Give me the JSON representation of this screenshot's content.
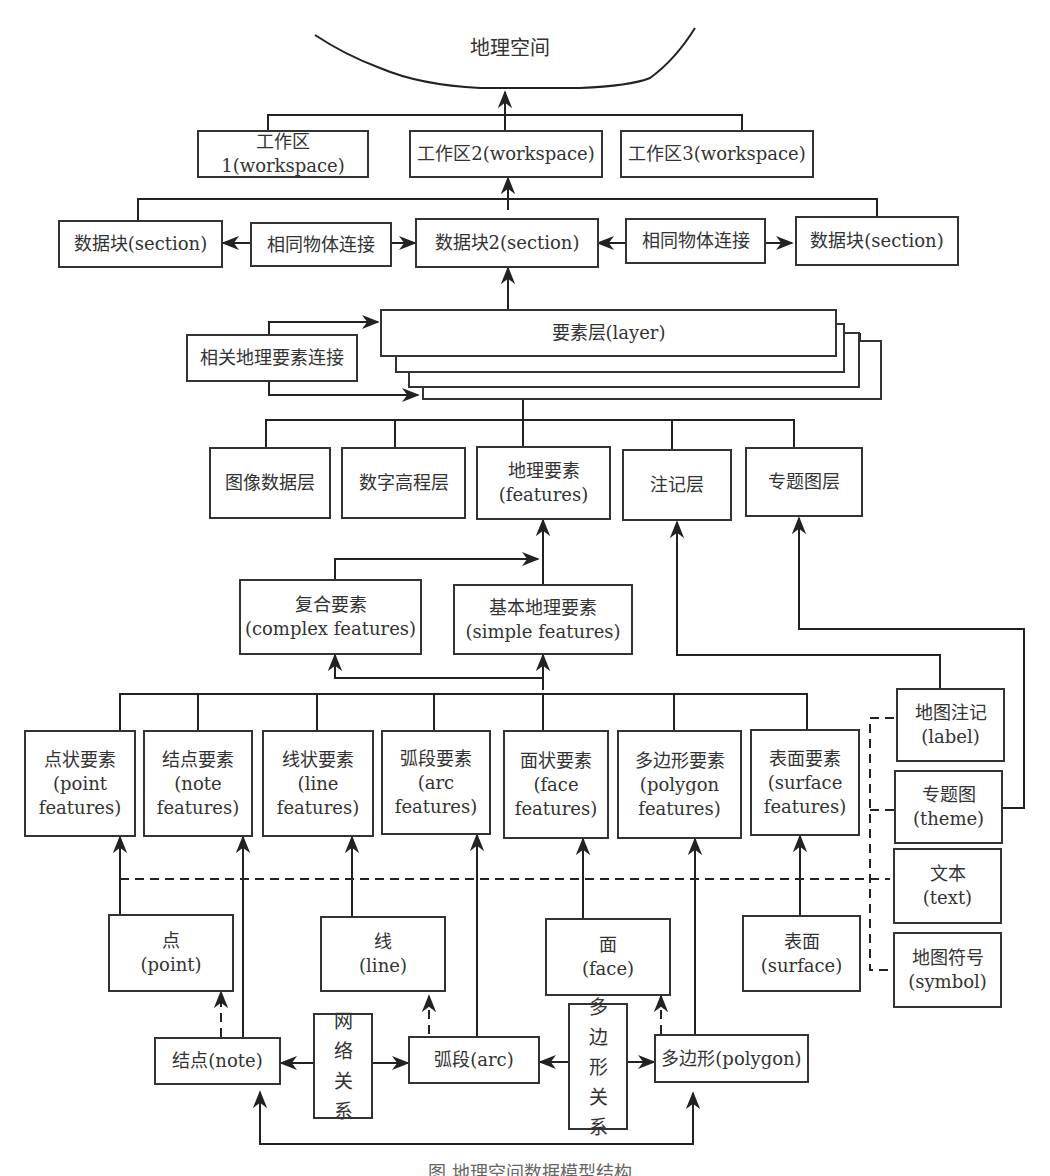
{
  "title": "地理空间",
  "workspaces": [
    {
      "label": "工作区1(workspace)"
    },
    {
      "label": "工作区2(workspace)"
    },
    {
      "label": "工作区3(workspace)"
    }
  ],
  "sections": {
    "left": "数据块(section)",
    "center": "数据块2(section)",
    "right": "数据块(section)",
    "link_left": "相同物体连接",
    "link_right": "相同物体连接"
  },
  "layer": {
    "label": "要素层(layer)",
    "link": "相关地理要素连接"
  },
  "layer_types": [
    {
      "line1": "图像数据层",
      "line2": ""
    },
    {
      "line1": "数字高程层",
      "line2": ""
    },
    {
      "line1": "地理要素",
      "line2": "(features)"
    },
    {
      "line1": "注记层",
      "line2": ""
    },
    {
      "line1": "专题图层",
      "line2": ""
    }
  ],
  "feature_kinds": [
    {
      "line1": "复合要素",
      "line2": "(complex features)"
    },
    {
      "line1": "基本地理要素",
      "line2": "(simple features)"
    }
  ],
  "simple_features": [
    {
      "line1": "点状要素",
      "line2": "(point",
      "line3": "features)"
    },
    {
      "line1": "结点要素",
      "line2": "(note",
      "line3": "features)"
    },
    {
      "line1": "线状要素",
      "line2": "(line",
      "line3": "features)"
    },
    {
      "line1": "弧段要素",
      "line2": "(arc",
      "line3": "features)"
    },
    {
      "line1": "面状要素",
      "line2": "(face",
      "line3": "features)"
    },
    {
      "line1": "多边形要素",
      "line2": "(polygon",
      "line3": "features)"
    },
    {
      "line1": "表面要素",
      "line2": "(surface",
      "line3": "features)"
    }
  ],
  "annotations": [
    {
      "line1": "地图注记",
      "line2": "(label)"
    },
    {
      "line1": "专题图",
      "line2": "(theme)"
    },
    {
      "line1": "文本",
      "line2": "(text)"
    },
    {
      "line1": "地图符号",
      "line2": "(symbol)"
    }
  ],
  "primitives": [
    {
      "line1": "点",
      "line2": "(point)"
    },
    {
      "line1": "线",
      "line2": "(line)"
    },
    {
      "line1": "面",
      "line2": "(face)"
    },
    {
      "line1": "表面",
      "line2": "(surface)"
    }
  ],
  "topology": {
    "node": "结点(note)",
    "arc": "弧段(arc)",
    "polygon": "多边形(polygon)",
    "network_relation": [
      "网",
      "络",
      "关",
      "系"
    ],
    "polygon_relation": [
      "多",
      "边",
      "形",
      "关",
      "系"
    ]
  },
  "caption": "图  地理空间数据模型结构"
}
